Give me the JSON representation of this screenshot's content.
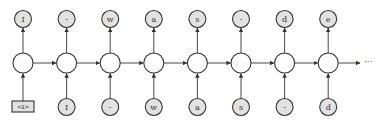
{
  "diagram": {
    "type": "unrolled-rnn-character-model",
    "outputs": [
      "I",
      "-",
      "w",
      "a",
      "s",
      "-",
      "d",
      "e"
    ],
    "inputs": [
      "<s>",
      "I",
      "-",
      "w",
      "a",
      "s",
      "-",
      "d"
    ],
    "continuation": "···",
    "colors": {
      "token_fill": "#e2e2e2",
      "hidden_fill": "#ffffff",
      "stroke": "#333333"
    }
  }
}
